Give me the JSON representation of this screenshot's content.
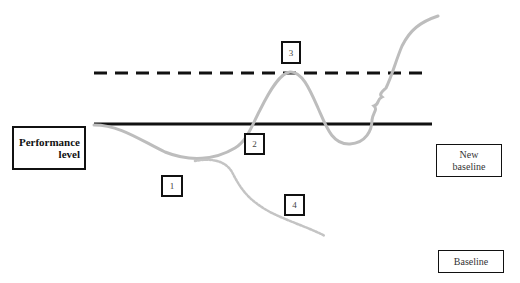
{
  "diagram": {
    "labels": {
      "performance_level": "Performance\nlevel",
      "new_baseline": "New\nbaseline",
      "baseline": "Baseline"
    },
    "markers": [
      {
        "id": "1",
        "label": "1"
      },
      {
        "id": "2",
        "label": "2"
      },
      {
        "id": "3",
        "label": "3"
      },
      {
        "id": "4",
        "label": "4"
      }
    ],
    "lines": {
      "new_baseline_style": "dashed",
      "baseline_style": "solid",
      "line_color": "#000000",
      "curve_color": "#bdbdbd",
      "branch_style": "dotted"
    }
  }
}
